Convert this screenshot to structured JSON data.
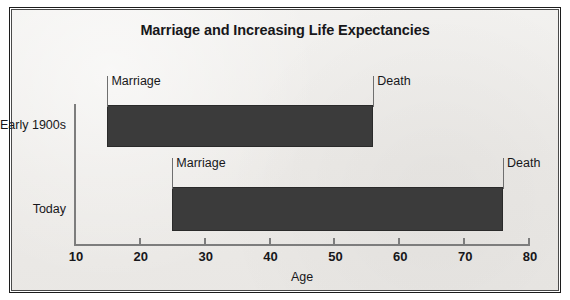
{
  "chart_data": {
    "type": "bar",
    "title": "Marriage and Increasing Life Expectancies",
    "xlabel": "Age",
    "ylabel": "",
    "orientation": "horizontal",
    "bar_style": "range",
    "xlim": [
      10,
      80
    ],
    "xticks": [
      10,
      20,
      30,
      40,
      50,
      60,
      70,
      80
    ],
    "xtick_labels": [
      "10",
      "20",
      "30",
      "40",
      "50",
      "60",
      "70",
      "80"
    ],
    "grid": false,
    "legend": null,
    "categories": [
      "Early 1900s",
      "Today"
    ],
    "series": [
      {
        "name": "Marriage",
        "values": [
          15,
          25
        ]
      },
      {
        "name": "Death",
        "values": [
          56,
          76
        ]
      }
    ],
    "bars": [
      {
        "category": "Early 1900s",
        "start": 15,
        "end": 56,
        "span": 41,
        "start_label": "Marriage",
        "end_label": "Death"
      },
      {
        "category": "Today",
        "start": 25,
        "end": 76,
        "span": 51,
        "start_label": "Marriage",
        "end_label": "Death"
      }
    ],
    "colors": {
      "bar_fill": "#3b3b3b",
      "bar_edge": "#2a2a2a",
      "panel_background": "#efeeec",
      "frame_border": "#1c1c1c",
      "axis": "#7d7d7d",
      "text": "#17171a"
    }
  }
}
